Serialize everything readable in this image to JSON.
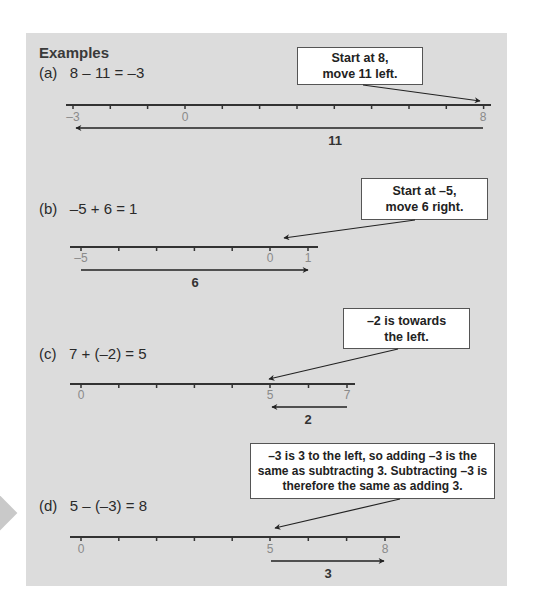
{
  "heading": "Examples",
  "examples": [
    {
      "label": "(a)",
      "equation": "8 – 11 = –3",
      "callout": "Start at 8,\nmove 11 left.",
      "callout_lines": [
        "Start at 8,",
        "move 11 left."
      ],
      "tick_labels": [
        "–3",
        "0",
        "8"
      ],
      "move_label": "11",
      "direction": "left"
    },
    {
      "label": "(b)",
      "equation": "–5 + 6 = 1",
      "callout_lines": [
        "Start at –5,",
        "move 6 right."
      ],
      "tick_labels": [
        "–5",
        "0",
        "1"
      ],
      "move_label": "6",
      "direction": "right"
    },
    {
      "label": "(c)",
      "equation": "7 + (–2) = 5",
      "callout_lines": [
        "–2 is towards",
        "the left."
      ],
      "tick_labels": [
        "0",
        "5",
        "7"
      ],
      "move_label": "2",
      "direction": "left"
    },
    {
      "label": "(d)",
      "equation": "5 – (–3) = 8",
      "callout_lines": [
        "–3 is 3 to the left, so adding –3 is the",
        "same as subtracting 3. Subtracting –3 is",
        "therefore the same as adding 3."
      ],
      "tick_labels": [
        "0",
        "5",
        "8"
      ],
      "move_label": "3",
      "direction": "right"
    }
  ],
  "colors": {
    "panel_bg": "#dcdcdc",
    "line": "#333333",
    "tick_label": "#8a8a8a",
    "callout_bg": "#ffffff"
  }
}
